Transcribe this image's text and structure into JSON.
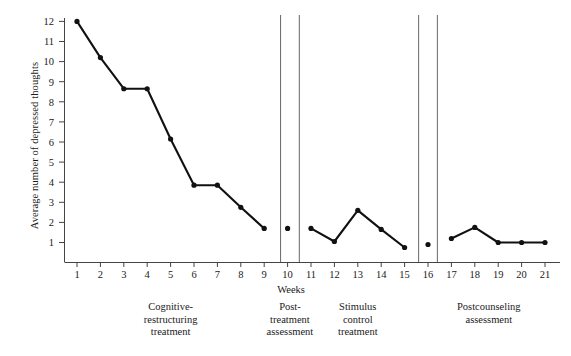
{
  "chart_data": {
    "type": "line",
    "title": "",
    "xlabel": "Weeks",
    "ylabel": "Average number of depressed thoughts",
    "xlim": [
      0.35,
      21.65
    ],
    "ylim": [
      0,
      12.45
    ],
    "grid": false,
    "legend": "none",
    "x_ticks": [
      1,
      2,
      3,
      4,
      5,
      6,
      7,
      8,
      9,
      10,
      11,
      12,
      13,
      14,
      15,
      16,
      17,
      18,
      19,
      20,
      21
    ],
    "y_ticks": [
      1,
      2,
      3,
      4,
      5,
      6,
      7,
      8,
      9,
      10,
      11,
      12
    ],
    "marker": "filled-circle",
    "series": [
      {
        "name": "Cognitive-restructuring treatment",
        "connected": true,
        "x": [
          1,
          2,
          3,
          4,
          5,
          6,
          7,
          8,
          9
        ],
        "values": [
          12.0,
          10.2,
          8.65,
          8.65,
          6.15,
          3.85,
          3.85,
          2.75,
          1.7
        ]
      },
      {
        "name": "Post-treatment assessment",
        "connected": false,
        "x": [
          10
        ],
        "values": [
          1.7
        ]
      },
      {
        "name": "Stimulus control treatment",
        "connected": true,
        "x": [
          11,
          12,
          13,
          14,
          15
        ],
        "values": [
          1.7,
          1.05,
          2.6,
          1.65,
          0.75
        ]
      },
      {
        "name": "Postcounseling assessment isolated",
        "connected": false,
        "x": [
          16
        ],
        "values": [
          0.9
        ]
      },
      {
        "name": "Postcounseling assessment",
        "connected": true,
        "x": [
          17,
          18,
          19,
          20,
          21
        ],
        "values": [
          1.2,
          1.75,
          1.0,
          1.0,
          1.0
        ]
      }
    ],
    "phase_dividers": [
      9.7,
      10.5,
      15.6,
      16.4
    ],
    "phases": [
      {
        "id": "cognitive-restructuring",
        "lines": [
          "Cognitive-",
          "restructuring",
          "treatment"
        ],
        "center_x": 5.0
      },
      {
        "id": "post-treatment",
        "lines": [
          "Post-",
          "treatment",
          "assessment"
        ],
        "center_x": 10.1
      },
      {
        "id": "stimulus-control",
        "lines": [
          "Stimulus",
          "control",
          "treatment"
        ],
        "center_x": 13.0
      },
      {
        "id": "postcounseling",
        "lines": [
          "Postcounseling",
          "assessment"
        ],
        "center_x": 18.6
      }
    ],
    "colors": {
      "line": "#111111",
      "marker": "#111111",
      "axis": "#444444",
      "divider": "#666666",
      "background": "#ffffff"
    }
  }
}
